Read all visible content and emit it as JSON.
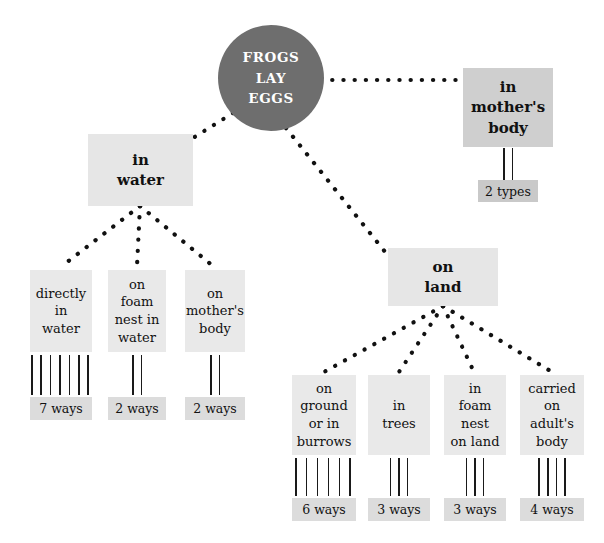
{
  "diagram": {
    "colors": {
      "root_fill": "#6e6e6e",
      "root_text": "#ffffff",
      "box_fill": "#e6e6e6",
      "box_fill_dark": "#cfcfcf",
      "count_fill": "#dcdcdc",
      "line": "#111111",
      "background": "#ffffff"
    },
    "root": {
      "lines": [
        "FROGS",
        "LAY",
        "EGGS"
      ]
    },
    "branches": [
      {
        "id": "in-water",
        "lines": [
          "in",
          "water"
        ],
        "children": [
          {
            "id": "directly-in-water",
            "lines": [
              "directly",
              "in",
              "water"
            ],
            "tally_count": 7,
            "count_label": "7 ways"
          },
          {
            "id": "on-foam-nest-in-water",
            "lines": [
              "on",
              "foam",
              "nest in",
              "water"
            ],
            "tally_count": 2,
            "count_label": "2 ways"
          },
          {
            "id": "on-mothers-body",
            "lines": [
              "on",
              "mother's",
              "body"
            ],
            "tally_count": 2,
            "count_label": "2 ways"
          }
        ]
      },
      {
        "id": "on-land",
        "lines": [
          "on",
          "land"
        ],
        "children": [
          {
            "id": "on-ground-or-in-burrows",
            "lines": [
              "on",
              "ground",
              "or in",
              "burrows"
            ],
            "tally_count": 6,
            "count_label": "6 ways"
          },
          {
            "id": "in-trees",
            "lines": [
              "in",
              "trees"
            ],
            "tally_count": 3,
            "count_label": "3 ways"
          },
          {
            "id": "in-foam-nest-on-land",
            "lines": [
              "in",
              "foam",
              "nest",
              "on land"
            ],
            "tally_count": 3,
            "count_label": "3 ways"
          },
          {
            "id": "carried-on-adults-body",
            "lines": [
              "carried",
              "on",
              "adult's",
              "body"
            ],
            "tally_count": 4,
            "count_label": "4 ways"
          }
        ]
      },
      {
        "id": "in-mothers-body",
        "lines": [
          "in",
          "mother's",
          "body"
        ],
        "tally_count": 2,
        "count_label": "2 types"
      }
    ]
  }
}
